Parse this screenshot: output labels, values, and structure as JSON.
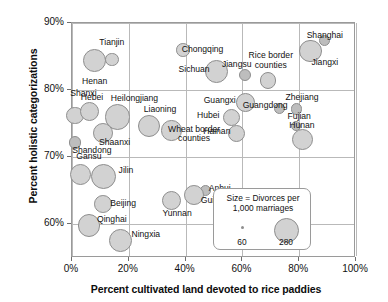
{
  "chart_data": {
    "type": "scatter",
    "title": "",
    "xlabel": "Percent cultivated land devoted to rice paddies",
    "ylabel": "Percent holistic categorizations",
    "xlim": [
      0,
      100
    ],
    "ylim": [
      55,
      90
    ],
    "xticks": [
      "0%",
      "20%",
      "40%",
      "60%",
      "80%",
      "100%"
    ],
    "xtick_values": [
      0,
      20,
      40,
      60,
      80,
      100
    ],
    "yticks": [
      "90%",
      "80%",
      "70%",
      "60%"
    ],
    "ytick_values": [
      90,
      80,
      70,
      60
    ],
    "grid": true,
    "legend_position": "inside-lower-right",
    "size_encoding": "Divorces per 1,000 marriages",
    "size_legend": {
      "small_value": "60",
      "large_value": "280"
    },
    "points": [
      {
        "name": "Henan",
        "x": 8,
        "y": 84.4,
        "size": 200,
        "lx": 8,
        "ly": 81.2,
        "anchor": "ctr"
      },
      {
        "name": "Tianjin",
        "x": 14,
        "y": 84.6,
        "size": 70,
        "lx": 14,
        "ly": 87.0,
        "anchor": "ctr"
      },
      {
        "name": "Shanxi",
        "x": 1,
        "y": 76.2,
        "size": 120,
        "lx": 4,
        "ly": 79.4,
        "anchor": "ctr"
      },
      {
        "name": "Hebei",
        "x": 6,
        "y": 76.8,
        "size": 140,
        "lx": 7,
        "ly": 78.8,
        "anchor": "ctr"
      },
      {
        "name": "Heilongjiang",
        "x": 16,
        "y": 76.0,
        "size": 250,
        "lx": 22,
        "ly": 78.7,
        "anchor": "ctr"
      },
      {
        "name": "Liaoning",
        "x": 27,
        "y": 74.6,
        "size": 190,
        "lx": 31,
        "ly": 77.1,
        "anchor": "ctr"
      },
      {
        "name": "Wheat border counties",
        "x": 35,
        "y": 74.0,
        "size": 160,
        "lx": 43,
        "ly": 73.4,
        "anchor": "ctr"
      },
      {
        "name": "Shaanxi",
        "x": 11,
        "y": 73.6,
        "size": 150,
        "lx": 15,
        "ly": 72.2,
        "anchor": "ctr"
      },
      {
        "name": "Shandong",
        "x": 1,
        "y": 72.2,
        "size": 60,
        "lx": 7,
        "ly": 70.9,
        "anchor": "ctr"
      },
      {
        "name": "Gansu",
        "x": 3,
        "y": 67.4,
        "size": 170,
        "lx": 6,
        "ly": 70.0,
        "anchor": "ctr"
      },
      {
        "name": "Jilin",
        "x": 11,
        "y": 67.2,
        "size": 240,
        "lx": 19,
        "ly": 68.0,
        "anchor": "ctr"
      },
      {
        "name": "Beijing",
        "x": 11,
        "y": 63.0,
        "size": 120,
        "lx": 18,
        "ly": 63.0,
        "anchor": "ctr"
      },
      {
        "name": "Qinghai",
        "x": 6,
        "y": 59.8,
        "size": 200,
        "lx": 14,
        "ly": 60.7,
        "anchor": "ctr"
      },
      {
        "name": "Ningxia",
        "x": 17,
        "y": 57.6,
        "size": 200,
        "lx": 26,
        "ly": 58.4,
        "anchor": "ctr"
      },
      {
        "name": "Sichuan",
        "x": 51,
        "y": 82.8,
        "size": 200,
        "lx": 43,
        "ly": 83.0,
        "anchor": "ctr"
      },
      {
        "name": "Chongqing",
        "x": 39,
        "y": 86.0,
        "size": 70,
        "lx": 46,
        "ly": 86.0,
        "anchor": "ctr"
      },
      {
        "name": "Jiangsu",
        "x": 61,
        "y": 82.2,
        "size": 55,
        "lx": 58,
        "ly": 83.8,
        "anchor": "ctr"
      },
      {
        "name": "Rice border counties",
        "x": 69,
        "y": 81.4,
        "size": 105,
        "lx": 70,
        "ly": 84.3,
        "anchor": "ctr"
      },
      {
        "name": "Shanghai",
        "x": 89,
        "y": 87.4,
        "size": 45,
        "lx": 89,
        "ly": 88.1,
        "anchor": "ctr"
      },
      {
        "name": "Jiangxi",
        "x": 84,
        "y": 85.8,
        "size": 190,
        "lx": 89,
        "ly": 84.0,
        "anchor": "ctr"
      },
      {
        "name": "Guangxi",
        "x": 61,
        "y": 78.2,
        "size": 135,
        "lx": 52,
        "ly": 78.4,
        "anchor": "ctr"
      },
      {
        "name": "Guangdong",
        "x": 73,
        "y": 77.3,
        "size": 45,
        "lx": 68,
        "ly": 77.6,
        "anchor": "ctr"
      },
      {
        "name": "Zhejiang",
        "x": 79,
        "y": 77.2,
        "size": 50,
        "lx": 81,
        "ly": 78.8,
        "anchor": "ctr"
      },
      {
        "name": "Hubei",
        "x": 56,
        "y": 76.0,
        "size": 110,
        "lx": 48,
        "ly": 76.2,
        "anchor": "ctr"
      },
      {
        "name": "Fujian",
        "x": 79,
        "y": 74.6,
        "size": 40,
        "lx": 80,
        "ly": 76.0,
        "anchor": "ctr"
      },
      {
        "name": "Hainan",
        "x": 58,
        "y": 73.6,
        "size": 110,
        "lx": 51,
        "ly": 73.8,
        "anchor": "ctr"
      },
      {
        "name": "Hunan",
        "x": 81,
        "y": 72.7,
        "size": 170,
        "lx": 81,
        "ly": 74.6,
        "anchor": "ctr"
      },
      {
        "name": "Anhui",
        "x": 47,
        "y": 65.1,
        "size": 50,
        "lx": 52,
        "ly": 65.3,
        "anchor": "ctr"
      },
      {
        "name": "Guizhou",
        "x": 43,
        "y": 64.4,
        "size": 150,
        "lx": 51,
        "ly": 63.5,
        "anchor": "ctr"
      },
      {
        "name": "Yunnan",
        "x": 35,
        "y": 63.6,
        "size": 140,
        "lx": 37,
        "ly": 61.5,
        "anchor": "ctr"
      }
    ]
  },
  "legend": {
    "title_line1": "Size = Divorces per",
    "title_line2": "1,000 marriages",
    "small_label": "60",
    "large_label": "280"
  }
}
